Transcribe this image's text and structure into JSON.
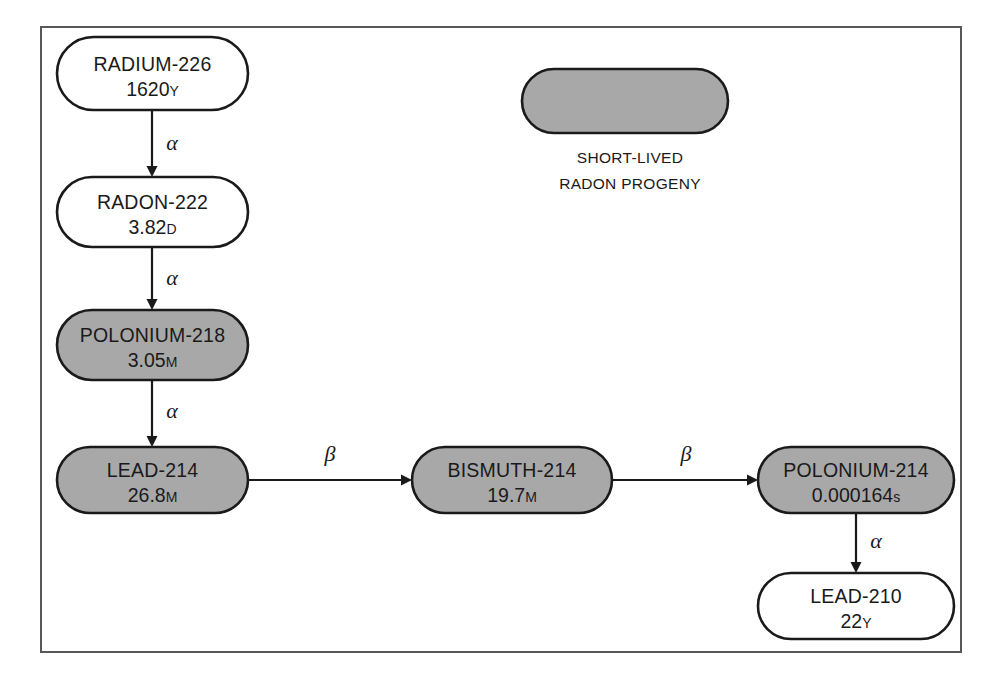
{
  "figure": {
    "kind": "decay-chain-diagram",
    "frame": {
      "x": 41,
      "y": 27,
      "width": 920,
      "height": 625
    },
    "colors": {
      "short_lived_fill": "#a8a8a8",
      "stable_fill": "#ffffff",
      "outline": "#1a1a1a",
      "frame_border": "#58585a",
      "background": "#ffffff"
    }
  },
  "nodes": [
    {
      "id": "radium-226",
      "name": "RADIUM-226",
      "half_life_value": "1620",
      "half_life_unit": "Y",
      "fill": "white",
      "x": 57,
      "y": 37,
      "w": 191,
      "h": 73
    },
    {
      "id": "radon-222",
      "name": "RADON-222",
      "half_life_value": "3.82",
      "half_life_unit": "D",
      "fill": "white",
      "x": 57,
      "y": 177,
      "w": 191,
      "h": 70
    },
    {
      "id": "polonium-218",
      "name": "POLONIUM-218",
      "half_life_value": "3.05",
      "half_life_unit": "M",
      "fill": "gray",
      "x": 57,
      "y": 310,
      "w": 191,
      "h": 70
    },
    {
      "id": "lead-214",
      "name": "LEAD-214",
      "half_life_value": "26.8",
      "half_life_unit": "M",
      "fill": "gray",
      "x": 57,
      "y": 447,
      "w": 191,
      "h": 66
    },
    {
      "id": "bismuth-214",
      "name": "BISMUTH-214",
      "half_life_value": "19.7",
      "half_life_unit": "M",
      "fill": "gray",
      "x": 412,
      "y": 447,
      "w": 200,
      "h": 66
    },
    {
      "id": "polonium-214",
      "name": "POLONIUM-214",
      "half_life_value": "0.000164",
      "half_life_unit": "s",
      "fill": "gray",
      "x": 758,
      "y": 447,
      "w": 196,
      "h": 66
    },
    {
      "id": "lead-210",
      "name": "LEAD-210",
      "half_life_value": "22",
      "half_life_unit": "Y",
      "fill": "white",
      "x": 758,
      "y": 573,
      "w": 196,
      "h": 66
    }
  ],
  "edges": [
    {
      "id": "ra226-rn222",
      "from": "radium-226",
      "to": "radon-222",
      "label": "α",
      "orientation": "vertical",
      "x1": 152,
      "y1": 110,
      "x2": 152,
      "y2": 177,
      "label_x": 172,
      "label_y": 150
    },
    {
      "id": "rn222-po218",
      "from": "radon-222",
      "to": "polonium-218",
      "label": "α",
      "orientation": "vertical",
      "x1": 152,
      "y1": 247,
      "x2": 152,
      "y2": 310,
      "label_x": 172,
      "label_y": 285
    },
    {
      "id": "po218-pb214",
      "from": "polonium-218",
      "to": "lead-214",
      "label": "α",
      "orientation": "vertical",
      "x1": 152,
      "y1": 380,
      "x2": 152,
      "y2": 447,
      "label_x": 172,
      "label_y": 418
    },
    {
      "id": "pb214-bi214",
      "from": "lead-214",
      "to": "bismuth-214",
      "label": "β",
      "orientation": "horizontal",
      "x1": 248,
      "y1": 480,
      "x2": 412,
      "y2": 480,
      "label_x": 330,
      "label_y": 461
    },
    {
      "id": "bi214-po214",
      "from": "bismuth-214",
      "to": "polonium-214",
      "label": "β",
      "orientation": "horizontal",
      "x1": 612,
      "y1": 480,
      "x2": 758,
      "y2": 480,
      "label_x": 686,
      "label_y": 461
    },
    {
      "id": "po214-pb210",
      "from": "polonium-214",
      "to": "lead-210",
      "label": "α",
      "orientation": "vertical",
      "x1": 856,
      "y1": 513,
      "x2": 856,
      "y2": 573,
      "label_x": 876,
      "label_y": 548
    }
  ],
  "legend": {
    "swatch": {
      "x": 522,
      "y": 69,
      "w": 206,
      "h": 64,
      "fill": "gray"
    },
    "line1": "SHORT-LIVED",
    "line2": "RADON PROGENY",
    "text_x": 630,
    "line1_y": 163,
    "line2_y": 189
  }
}
